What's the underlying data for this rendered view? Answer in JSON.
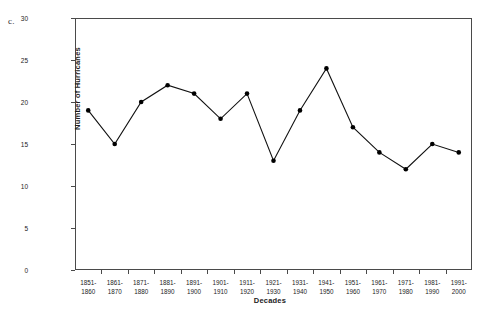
{
  "panel": {
    "label": "c."
  },
  "chart_data": {
    "type": "line",
    "title": "",
    "xlabel": "Decades",
    "ylabel": "Number of Hurricanes",
    "categories": [
      "1851-1860",
      "1861-1870",
      "1871-1880",
      "1881-1890",
      "1891-1900",
      "1901-1910",
      "1911-1920",
      "1921-1930",
      "1931-1940",
      "1941-1950",
      "1951-1960",
      "1961-1970",
      "1971-1980",
      "1981-1990",
      "1991-2000"
    ],
    "category_lines": [
      [
        "1851-",
        "1860"
      ],
      [
        "1861-",
        "1870"
      ],
      [
        "1871-",
        "1880"
      ],
      [
        "1881-",
        "1890"
      ],
      [
        "1891-",
        "1900"
      ],
      [
        "1901-",
        "1910"
      ],
      [
        "1911-",
        "1920"
      ],
      [
        "1921-",
        "1930"
      ],
      [
        "1931-",
        "1940"
      ],
      [
        "1941-",
        "1950"
      ],
      [
        "1951-",
        "1960"
      ],
      [
        "1961-",
        "1970"
      ],
      [
        "1971-",
        "1980"
      ],
      [
        "1981-",
        "1990"
      ],
      [
        "1991-",
        "2000"
      ]
    ],
    "values": [
      19,
      15,
      20,
      22,
      21,
      18,
      21,
      13,
      19,
      24,
      17,
      14,
      12,
      15,
      14
    ],
    "ylim": [
      0,
      30
    ],
    "yticks": [
      0,
      5,
      10,
      15,
      20,
      25,
      30
    ],
    "ytick_labels": [
      "0",
      "5",
      "10",
      "15",
      "20",
      "25",
      "30"
    ],
    "grid": false,
    "legend": null,
    "marker": "filled-circle",
    "line_color": "#111111",
    "marker_color": "#000000"
  }
}
